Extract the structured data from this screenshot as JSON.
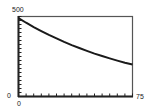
{
  "chart_data": {
    "type": "line",
    "title": "",
    "xlabel": "",
    "ylabel": "",
    "xlim": [
      0,
      75
    ],
    "ylim": [
      0,
      500
    ],
    "x_tick_step": 5,
    "y_tick_step": 25,
    "grid": false,
    "legend": null,
    "tick_labels": {
      "x_min": "0",
      "x_max": "75",
      "y_min": "0",
      "y_max": "500"
    },
    "series": [
      {
        "name": "exponential decay",
        "x": [
          0,
          5,
          10,
          15,
          20,
          25,
          30,
          35,
          40,
          45,
          50,
          55,
          60,
          65,
          70,
          75
        ],
        "values": [
          490,
          461,
          434,
          409,
          385,
          363,
          341,
          321,
          303,
          285,
          268,
          253,
          238,
          224,
          211,
          200
        ]
      }
    ]
  },
  "colors": {
    "curve": "#1a1a1a",
    "axes": "#222222",
    "frame": "#555555"
  }
}
